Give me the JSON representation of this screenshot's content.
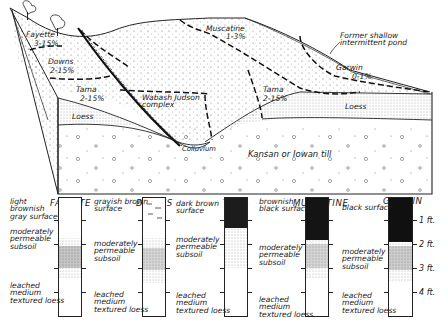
{
  "block_diagram": {
    "slope_labels": [
      {
        "name": "Fayette",
        "slope": "3-15%"
      },
      {
        "name": "Downs",
        "slope": "2-15%"
      },
      {
        "name": "Tama",
        "slope": "2-15%"
      },
      {
        "name": "Muscatine",
        "slope": "1-3%"
      },
      {
        "name": "Tama",
        "slope": "2-15%"
      },
      {
        "name": "Garwin",
        "slope": "0-1%"
      }
    ],
    "complex_label": "Wabash Judson\ncomplex",
    "pond_label": "Former shallow\nintermittent pond",
    "loess_left": "Loess",
    "loess_right": "Loess",
    "colluvium": "Colluvium",
    "till": "Kansan or Iowan till"
  },
  "profiles": [
    {
      "name": "FAYETTE",
      "surface": "light\nbrownish\ngray surface",
      "subsoil": "moderately\npermeable\nsubsoil",
      "parent": "leached\nmedium\ntextured loess",
      "surface_color": "#ffffff"
    },
    {
      "name": "DOWNS",
      "surface": "grayish brown\nsurface",
      "subsoil": "moderately\npermeable\nsubsoil",
      "parent": "leached\nmedium\ntextured loess",
      "surface_color": "#ffffff"
    },
    {
      "name": "TAMA",
      "surface": "dark brown\nsurface",
      "subsoil": "moderately\npermeable\nsubsoil",
      "parent": "leached\nmedium\ntextured loess",
      "surface_color": "#1c1c1c"
    },
    {
      "name": "MUSCATINE",
      "surface": "brownish\nblack surface",
      "subsoil": "moderately\npermeable\nsubsoil",
      "parent": "leached\nmedium\ntextured loess",
      "surface_color": "#141414"
    },
    {
      "name": "GARWIN",
      "surface": "black surface",
      "subsoil": "moderately\npermeable\nsubsoil",
      "parent": "leached\nmedium\ntextured loess",
      "surface_color": "#101010"
    }
  ],
  "depth_scale": [
    "1 ft.",
    "2 ft.",
    "3 ft.",
    "4 ft."
  ]
}
